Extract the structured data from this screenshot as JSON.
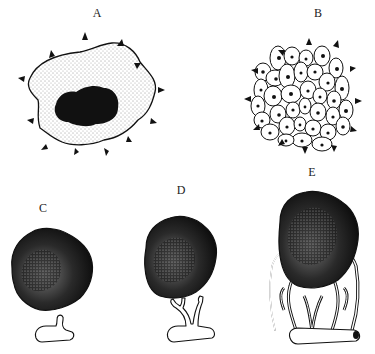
{
  "figure": {
    "background": "#ffffff",
    "ink_color": "#111111",
    "panels": [
      {
        "id": "A",
        "label": "A",
        "content": "single dormant tumor nodule with dark necrotic core, stippled outer region, surrounded by outward arrowheads"
      },
      {
        "id": "B",
        "label": "B",
        "content": "cluster of polygonal cells with dark nuclei, surrounded by outward arrowheads"
      },
      {
        "id": "C",
        "label": "C",
        "content": "avascular stippled tumor mass with small vessel sprout beginning below"
      },
      {
        "id": "D",
        "label": "D",
        "content": "tumor mass with branching vessel sprouts extending toward it"
      },
      {
        "id": "E",
        "label": "E",
        "content": "vascularized tumor mass enveloped by branching capillary network from parent vessel"
      }
    ]
  }
}
